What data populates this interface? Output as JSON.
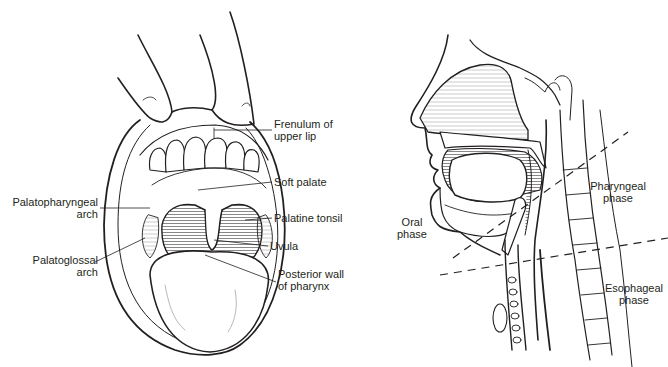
{
  "figure": {
    "left_panel": {
      "name": "open-mouth-view",
      "labels": {
        "frenulum": [
          "Frenulum of",
          "upper lip"
        ],
        "soft_palate": [
          "Soft palate"
        ],
        "palatine_tonsil": [
          "Palatine tonsil"
        ],
        "uvula": [
          "Uvula"
        ],
        "posterior_wall": [
          "Posterior wall",
          "of pharynx"
        ],
        "palatopharyngeal": [
          "Palatopharyngeal",
          "arch"
        ],
        "palatoglossal": [
          "Palatoglossal",
          "arch"
        ]
      }
    },
    "right_panel": {
      "name": "sagittal-swallowing-phases",
      "labels": {
        "oral": [
          "Oral",
          "phase"
        ],
        "pharyngeal": [
          "Pharyngeal",
          "phase"
        ],
        "esophageal": [
          "Esophageal",
          "phase"
        ]
      }
    },
    "colors": {
      "ink": "#231f20",
      "background": "#ffffff",
      "shade": "#8a8a8a"
    }
  }
}
